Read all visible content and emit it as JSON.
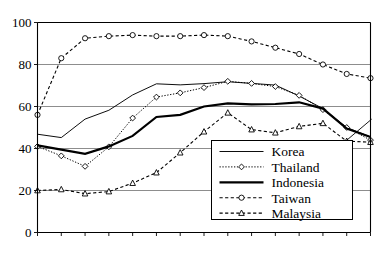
{
  "chart_data": {
    "type": "line",
    "title": "",
    "xlabel": "",
    "ylabel": "",
    "xlim": [
      1985,
      1999
    ],
    "ylim": [
      0,
      100
    ],
    "yticks": [
      0,
      20,
      40,
      60,
      80,
      100
    ],
    "grid": "horizontal",
    "legend_position": "lower-right-inside",
    "x": [
      1985,
      1986,
      1987,
      1988,
      1989,
      1990,
      1991,
      1992,
      1993,
      1994,
      1995,
      1996,
      1997,
      1998,
      1999
    ],
    "xtick_labels": [
      "1985",
      "",
      "1987",
      "",
      "1989",
      "",
      "1991",
      "",
      "1993",
      "",
      "1995",
      "",
      "1997",
      "",
      "1999"
    ],
    "xtick_labels_visible": [
      "1985",
      "1987",
      "1989",
      "1991",
      "1993",
      "1995",
      "1997",
      "1999"
    ],
    "xtick_rotation_deg": 90,
    "series": [
      {
        "name": "Korea",
        "style": "solid-thin",
        "marker": "none",
        "values": [
          46.8,
          45.2,
          54.0,
          58.2,
          65.5,
          70.8,
          70.3,
          70.9,
          71.8,
          71.0,
          70.2,
          65.0,
          59.0,
          50.0,
          45.5
        ]
      },
      {
        "name": "Thailand",
        "style": "dotted",
        "marker": "diamond",
        "values": [
          41.0,
          36.5,
          31.5,
          40.8,
          54.5,
          64.5,
          66.5,
          69.0,
          72.0,
          71.0,
          69.5,
          65.3,
          58.5,
          50.0,
          44.0
        ]
      },
      {
        "name": "Indonesia",
        "style": "solid-thick",
        "marker": "none",
        "values": [
          41.5,
          39.5,
          37.5,
          41.0,
          46.0,
          55.0,
          56.0,
          60.0,
          61.5,
          61.0,
          61.2,
          62.0,
          59.0,
          49.5,
          45.5
        ]
      },
      {
        "name": "Taiwan",
        "style": "dashed",
        "marker": "circle",
        "values": [
          56.0,
          83.0,
          92.5,
          93.5,
          94.0,
          93.5,
          93.5,
          94.0,
          93.5,
          91.0,
          88.0,
          85.0,
          80.0,
          75.5,
          73.5
        ]
      },
      {
        "name": "Malaysia",
        "style": "dashed",
        "marker": "triangle",
        "values": [
          20.0,
          20.5,
          18.5,
          19.5,
          23.5,
          28.5,
          38.0,
          48.0,
          57.0,
          49.0,
          47.5,
          50.5,
          52.0,
          43.5,
          43.0
        ]
      }
    ],
    "annotation": {
      "type": "leader-line",
      "from_x": 1999.05,
      "from_y": 54.0,
      "to_x": 1997.85,
      "to_y": 42.5
    }
  },
  "legend": {
    "items": [
      {
        "label": "Korea",
        "key": "korea-legend-item"
      },
      {
        "label": "Thailand",
        "key": "thailand-legend-item"
      },
      {
        "label": "Indonesia",
        "key": "indonesia-legend-item"
      },
      {
        "label": "Taiwan",
        "key": "taiwan-legend-item"
      },
      {
        "label": "Malaysia",
        "key": "malaysia-legend-item"
      }
    ]
  },
  "axes": {
    "y_tick_0": "0",
    "y_tick_20": "20",
    "y_tick_40": "40",
    "y_tick_60": "60",
    "y_tick_80": "80",
    "y_tick_100": "100",
    "x_tick_1985": "1985",
    "x_tick_1987": "1987",
    "x_tick_1989": "1989",
    "x_tick_1991": "1991",
    "x_tick_1993": "1993",
    "x_tick_1995": "1995",
    "x_tick_1997": "1997",
    "x_tick_1999": "1999"
  },
  "colors": {
    "ink": "#000000",
    "grid": "#808080",
    "background": "#ffffff"
  }
}
